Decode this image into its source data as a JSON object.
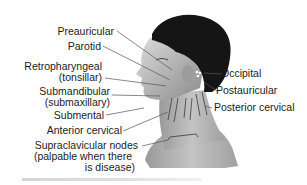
{
  "figure": {
    "labels_left": [
      {
        "id": "preauricular",
        "text": "Preauricular"
      },
      {
        "id": "parotid",
        "text": "Parotid"
      },
      {
        "id": "retropharyngeal",
        "line1": "Retropharyngeal",
        "line2": "(tonsillar)"
      },
      {
        "id": "submandibular",
        "line1": "Submandibular",
        "line2": "(submaxillary)"
      },
      {
        "id": "submental",
        "text": "Submental"
      },
      {
        "id": "anterior_cervical",
        "text": "Anterior cervical"
      },
      {
        "id": "supraclavicular",
        "line1": "Supraclavicular nodes",
        "line2": "(palpable when there",
        "line3": "is disease)"
      }
    ],
    "labels_right": [
      {
        "id": "occipital",
        "text": "Occipital"
      },
      {
        "id": "postauricular",
        "text": "Postauricular"
      },
      {
        "id": "posterior_cervical",
        "text": "Posterior cervical"
      }
    ],
    "colors": {
      "hair": "#141414",
      "skin_light": "#d8d8d8",
      "skin_mid": "#a9a9a9",
      "skin_dark": "#6e6e6e",
      "leader_line": "#555555",
      "node_outline": "#3a3a3a"
    }
  }
}
